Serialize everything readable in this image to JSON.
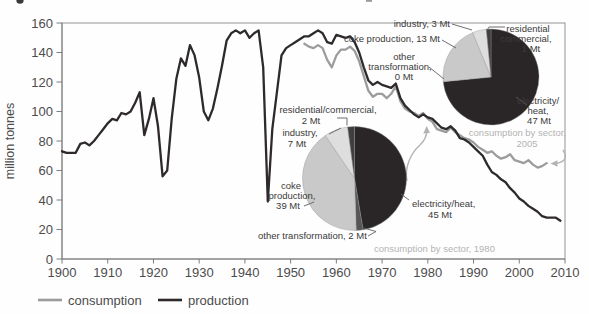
{
  "y_axis": {
    "label": "million tonnes"
  },
  "legend": {
    "items": [
      {
        "label": "consumption"
      },
      {
        "label": "production"
      }
    ]
  },
  "colors": {
    "production_line": "#2e2a2b",
    "consumption_line": "#9c9c9c",
    "pie_electricity": "#2a2627",
    "pie_coke": "#c9c9c9",
    "pie_industry": "#dedede",
    "pie_residential": "#3f3f3f",
    "pie_other": "#565656",
    "caption_gray": "#b3b3b3"
  },
  "labels_2005": {
    "industry": "industry, 3 Mt",
    "coke": "coke production, 13 Mt",
    "other1": "other",
    "other2": "transformation,",
    "other3": "0 Mt",
    "res1": "residential",
    "res2": "commercial,",
    "res3": "1 Mt",
    "elec1": "electricity/",
    "elec2": "heat,",
    "elec3": "47 Mt",
    "caption1": "consumption by sector,",
    "caption2": "2005"
  },
  "labels_1980": {
    "res1": "residential/commercial,",
    "res2": "2 Mt",
    "ind1": "industry,",
    "ind2": "7 Mt",
    "coke1": "coke",
    "coke2": "production,",
    "coke3": "39 Mt",
    "other": "other transformation, 2 Mt",
    "elec1": "electricity/heat,",
    "elec2": "45 Mt",
    "caption": "consumption by sector, 1980"
  },
  "chart_data": [
    {
      "type": "line",
      "title": "",
      "xlabel": "",
      "ylabel": "million tonnes",
      "xlim": [
        1900,
        2010
      ],
      "ylim": [
        0,
        160
      ],
      "x_ticks": [
        1900,
        1910,
        1920,
        1930,
        1940,
        1950,
        1960,
        1970,
        1980,
        1990,
        2000,
        2010
      ],
      "y_ticks": [
        0,
        20,
        40,
        60,
        80,
        100,
        120,
        140,
        160
      ],
      "grid": false,
      "legend_position": "bottom-left",
      "series": [
        {
          "name": "consumption",
          "color": "#9c9c9c",
          "x_start": 1953,
          "x_step": 1,
          "values": [
            146,
            144,
            143,
            145,
            143,
            135,
            130,
            138,
            142,
            142,
            144,
            141,
            134,
            124,
            114,
            110,
            112,
            112,
            109,
            112,
            117,
            107,
            102,
            100,
            99,
            97,
            99,
            95,
            93,
            88,
            87,
            86,
            89,
            86,
            84,
            82,
            81,
            79,
            76,
            74,
            72,
            73,
            70,
            68,
            69,
            71,
            67,
            66,
            65,
            67,
            64,
            62,
            63,
            65
          ]
        },
        {
          "name": "production",
          "color": "#2e2a2b",
          "x_start": 1900,
          "x_step": 1,
          "values": [
            73,
            72,
            72,
            72,
            78,
            79,
            77,
            80,
            84,
            88,
            92,
            95,
            94,
            99,
            98,
            100,
            106,
            113,
            84,
            95,
            109,
            90,
            56,
            60,
            95,
            122,
            136,
            131,
            145,
            138,
            123,
            100,
            94,
            102,
            116,
            131,
            148,
            153,
            155,
            153,
            155,
            150,
            153,
            155,
            130,
            39,
            88,
            113,
            138,
            143,
            145,
            147,
            149,
            151,
            151,
            153,
            155,
            153,
            147,
            146,
            152,
            151,
            150,
            151,
            147,
            140,
            130,
            121,
            118,
            120,
            118,
            117,
            116,
            119,
            109,
            104,
            101,
            98,
            96,
            98,
            96,
            95,
            92,
            89,
            88,
            90,
            87,
            82,
            81,
            79,
            76,
            73,
            70,
            64,
            59,
            57,
            54,
            52,
            48,
            45,
            41,
            39,
            36,
            34,
            32,
            29,
            28,
            28,
            28,
            26
          ]
        }
      ]
    },
    {
      "type": "pie",
      "title": "consumption by sector, 1980",
      "unit": "Mt",
      "total": 95,
      "start_angle_deg": 0,
      "direction": "clockwise",
      "center": [
        354.5,
        178.5
      ],
      "radius": 52,
      "slices": [
        {
          "label": "electricity/heat",
          "value": 45,
          "color": "#2a2627"
        },
        {
          "label": "other transformation",
          "value": 2,
          "color": "#565656"
        },
        {
          "label": "coke production",
          "value": 39,
          "color": "#c9c9c9"
        },
        {
          "label": "industry",
          "value": 7,
          "color": "#dedede"
        },
        {
          "label": "residential/commercial",
          "value": 2,
          "color": "#3f3f3f"
        }
      ]
    },
    {
      "type": "pie",
      "title": "consumption by sector, 2005",
      "unit": "Mt",
      "total": 64,
      "start_angle_deg": 0,
      "direction": "clockwise",
      "center": [
        491,
        77
      ],
      "radius": 48,
      "slices": [
        {
          "label": "electricity/heat",
          "value": 47,
          "color": "#2a2627"
        },
        {
          "label": "other transformation",
          "value": 0,
          "color": "#565656"
        },
        {
          "label": "coke production",
          "value": 13,
          "color": "#c9c9c9"
        },
        {
          "label": "industry",
          "value": 3,
          "color": "#dedede"
        },
        {
          "label": "residential commercial",
          "value": 1,
          "color": "#3f3f3f"
        }
      ]
    }
  ]
}
